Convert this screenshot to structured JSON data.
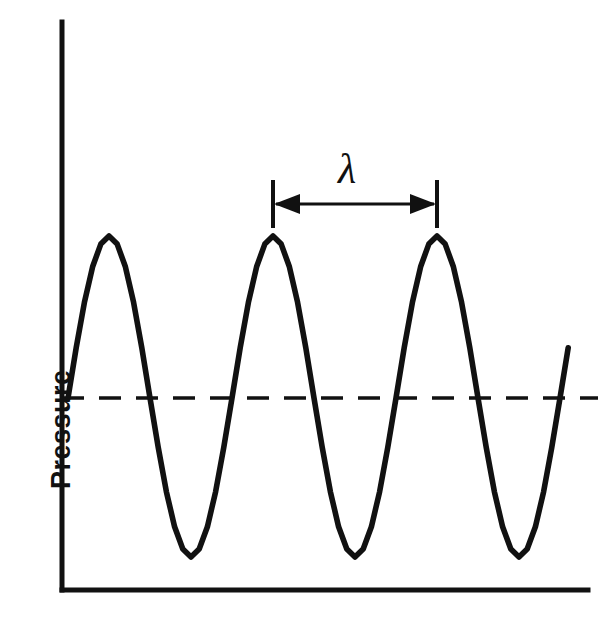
{
  "figure": {
    "title": "",
    "background_color": "#ffffff",
    "line_color": "#111111",
    "width": 612,
    "height": 631
  },
  "axes": {
    "y_axis_label": "Pressure",
    "x_axis_label": "",
    "x_tick_labels": [],
    "y_tick_labels": [],
    "origin_x": 62,
    "origin_y": 590,
    "y_axis_top": 22,
    "x_axis_right": 588
  },
  "annotations": {
    "wavelength_symbol": "λ",
    "wavelength_symbol_name": "lambda",
    "measure_left_x": 273,
    "measure_right_x": 437,
    "measure_line_y": 204,
    "tick_top_y": 180,
    "tick_bottom_y": 228,
    "label_x": 338,
    "label_y": 148
  },
  "zero_line": {
    "label": "equilibrium-pressure",
    "y": 398,
    "x_start": 62,
    "x_end": 598,
    "style": "dashed"
  },
  "chart_data": {
    "type": "line",
    "title": "",
    "xlabel": "",
    "ylabel": "Pressure",
    "grid": false,
    "legend": false,
    "xlim": [
      0,
      3.1
    ],
    "ylim": [
      -1.15,
      1.15
    ],
    "wave": {
      "form": "sine",
      "amplitude": 1.0,
      "wavelength_px": 164,
      "wavelength_units": 1.0,
      "phase_deg": 0,
      "cycles_drawn": 3.05,
      "baseline": 0
    },
    "series": [
      {
        "name": "pressure",
        "x": [
          0.0,
          0.05,
          0.1,
          0.15,
          0.2,
          0.25,
          0.3,
          0.35,
          0.4,
          0.45,
          0.5,
          0.55,
          0.6,
          0.65,
          0.7,
          0.75,
          0.8,
          0.85,
          0.9,
          0.95,
          1.0,
          1.05,
          1.1,
          1.15,
          1.2,
          1.25,
          1.3,
          1.35,
          1.4,
          1.45,
          1.5,
          1.55,
          1.6,
          1.65,
          1.7,
          1.75,
          1.8,
          1.85,
          1.9,
          1.95,
          2.0,
          2.05,
          2.1,
          2.15,
          2.2,
          2.25,
          2.3,
          2.35,
          2.4,
          2.45,
          2.5,
          2.55,
          2.6,
          2.65,
          2.7,
          2.75,
          2.8,
          2.85,
          2.9,
          2.95,
          3.0,
          3.05
        ],
        "y": [
          0.0,
          0.31,
          0.59,
          0.81,
          0.95,
          1.0,
          0.95,
          0.81,
          0.59,
          0.31,
          0.0,
          -0.31,
          -0.59,
          -0.81,
          -0.95,
          -1.0,
          -0.95,
          -0.81,
          -0.59,
          -0.31,
          0.0,
          0.31,
          0.59,
          0.81,
          0.95,
          1.0,
          0.95,
          0.81,
          0.59,
          0.31,
          0.0,
          -0.31,
          -0.59,
          -0.81,
          -0.95,
          -1.0,
          -0.95,
          -0.81,
          -0.59,
          -0.31,
          0.0,
          0.31,
          0.59,
          0.81,
          0.95,
          1.0,
          0.95,
          0.81,
          0.59,
          0.31,
          0.0,
          -0.31,
          -0.59,
          -0.81,
          -0.95,
          -1.0,
          -0.95,
          -0.81,
          -0.59,
          -0.31,
          0.0,
          0.31
        ]
      }
    ],
    "crests_px": [
      [
        112,
        236
      ],
      [
        274,
        236
      ],
      [
        437,
        236
      ]
    ],
    "troughs_px": [
      [
        192,
        557
      ],
      [
        355,
        557
      ],
      [
        518,
        557
      ]
    ],
    "zero_crossings_px": [
      68,
      152,
      232,
      315,
      396,
      478,
      560
    ],
    "annotation_text": "λ"
  }
}
